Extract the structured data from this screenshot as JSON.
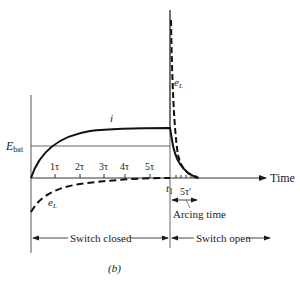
{
  "figure": {
    "caption": "(b)",
    "axis": {
      "x_label": "Time",
      "y_ref_label_main": "E",
      "y_ref_label_sub": "bat"
    },
    "curves": {
      "current_label": "i",
      "emf_label_main": "e",
      "emf_label_sub": "L",
      "emf_spike_label_main": "e",
      "emf_spike_label_sub": "L"
    },
    "ticks": [
      "1τ",
      "2τ",
      "3τ",
      "4τ",
      "5τ"
    ],
    "switch_time_main": "t",
    "switch_time_sub": "1",
    "arc_interval": "5τ′",
    "arc_label": "Arcing time",
    "phases": {
      "closed": "Switch closed",
      "open": "Switch open"
    }
  }
}
